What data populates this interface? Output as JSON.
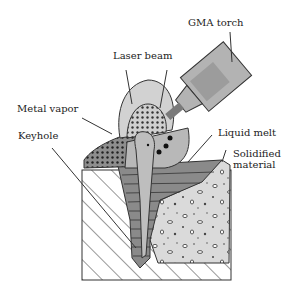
{
  "diagram": {
    "type": "hybrid laser-arc welding cross-section",
    "labels": {
      "gma_torch": "GMA torch",
      "laser_beam": "Laser beam",
      "metal_vapor": "Metal vapor",
      "keyhole": "Keyhole",
      "liquid_melt": "Liquid melt",
      "solidified_material": "Solidified\nmaterial"
    },
    "colors": {
      "torch": "#b5b5b5",
      "torch_inner": "#9a9a9a",
      "laser_cone": "#d8d8d8",
      "vapor_dots": "#555555",
      "liquid": "#a8a8a8",
      "keyhole": "#c8c8c8",
      "layers": "#7a7a7a",
      "solidified": "#dcdcdc",
      "outline": "#333333"
    }
  }
}
